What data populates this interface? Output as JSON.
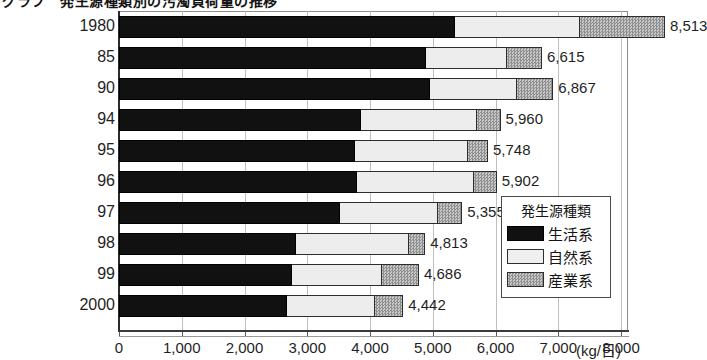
{
  "title": "グラフ　発生源種類別の汚濁負荷量の推移",
  "axis": {
    "x_unit": "(kg/日)",
    "x_ticks": [
      "0",
      "1,000",
      "2,000",
      "3,000",
      "4,000",
      "5,000",
      "6,000",
      "7,000",
      "8,000"
    ],
    "x_min": 0,
    "x_max": 8600
  },
  "legend": {
    "title": "発生源種類",
    "items": [
      {
        "label": "生活系",
        "swatch": "black",
        "color": "#111111"
      },
      {
        "label": "自然系",
        "swatch": "light",
        "color": "#ededed"
      },
      {
        "label": "産業系",
        "swatch": "gray",
        "color": "#a8a8a8"
      }
    ]
  },
  "chart_data": {
    "type": "bar",
    "orientation": "horizontal",
    "stacked": true,
    "title": "グラフ　発生源種類別の汚濁負荷量の推移",
    "xlabel": "(kg/日)",
    "ylabel": "",
    "xlim": [
      0,
      8600
    ],
    "grid": true,
    "legend_position": "inside-right",
    "categories": [
      "1980",
      "85",
      "90",
      "94",
      "95",
      "96",
      "97",
      "98",
      "99",
      "2000"
    ],
    "series": [
      {
        "name": "生活系",
        "values": [
          5620,
          4900,
          5040,
          3840,
          3740,
          3770,
          3490,
          2800,
          2720,
          2640
        ]
      },
      {
        "name": "自然系",
        "values": [
          2220,
          1195,
          1290,
          1770,
          1710,
          1790,
          1500,
          1770,
          1400,
          1360
        ]
      },
      {
        "name": "産業系",
        "values": [
          673,
          520,
          537,
          350,
          298,
          342,
          365,
          243,
          566,
          442
        ]
      }
    ],
    "totals": [
      8513,
      6615,
      6867,
      5960,
      5748,
      5902,
      5355,
      4813,
      4686,
      4442
    ],
    "total_labels": [
      "8,513",
      "6,615",
      "6,867",
      "5,960",
      "5,748",
      "5,902",
      "5,355",
      "4,813",
      "4,686",
      "4,442"
    ]
  },
  "rows": [
    {
      "year": "1980",
      "total_label": "8,513",
      "seg_black": 53.5,
      "seg_light": 20.0,
      "seg_gray": 13.5,
      "bar_total": 87.0,
      "top": 16
    },
    {
      "year": "85",
      "total_label": "6,615",
      "seg_black": 49.0,
      "seg_light": 12.8,
      "seg_gray": 5.6,
      "bar_total": 67.4,
      "top": 47
    },
    {
      "year": "90",
      "total_label": "6,867",
      "seg_black": 49.6,
      "seg_light": 13.8,
      "seg_gray": 5.8,
      "bar_total": 69.2,
      "top": 78
    },
    {
      "year": "94",
      "total_label": "5,960",
      "seg_black": 38.6,
      "seg_light": 18.5,
      "seg_gray": 3.7,
      "bar_total": 60.8,
      "top": 109
    },
    {
      "year": "95",
      "total_label": "5,748",
      "seg_black": 37.6,
      "seg_light": 18.0,
      "seg_gray": 3.2,
      "bar_total": 58.8,
      "top": 140
    },
    {
      "year": "96",
      "total_label": "5,902",
      "seg_black": 38.0,
      "seg_light": 18.6,
      "seg_gray": 3.6,
      "bar_total": 60.2,
      "top": 171
    },
    {
      "year": "97",
      "total_label": "5,355",
      "seg_black": 35.2,
      "seg_light": 15.6,
      "seg_gray": 3.9,
      "bar_total": 54.7,
      "top": 202
    },
    {
      "year": "98",
      "total_label": "4,813",
      "seg_black": 28.2,
      "seg_light": 18.0,
      "seg_gray": 2.6,
      "bar_total": 48.8,
      "top": 233
    },
    {
      "year": "99",
      "total_label": "4,686",
      "seg_black": 27.5,
      "seg_light": 14.4,
      "seg_gray": 5.9,
      "bar_total": 47.8,
      "top": 264
    },
    {
      "year": "2000",
      "total_label": "4,442",
      "seg_black": 26.8,
      "seg_light": 14.0,
      "seg_gray": 4.5,
      "bar_total": 45.3,
      "top": 295
    }
  ]
}
